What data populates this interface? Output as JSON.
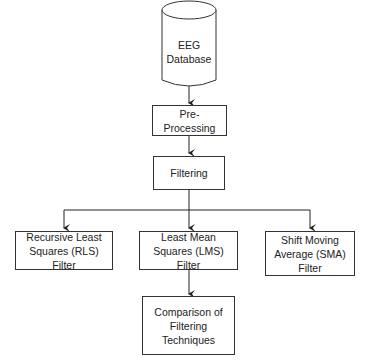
{
  "diagram": {
    "type": "flowchart",
    "nodes": {
      "database": {
        "line1": "EEG",
        "line2": "Database",
        "shape": "cylinder"
      },
      "preprocessing": {
        "label": "Pre-Processing"
      },
      "filtering": {
        "label": "Filtering"
      },
      "rls": {
        "label": "Recursive Least Squares (RLS) Filter"
      },
      "lms": {
        "label": "Least Mean Squares (LMS) Filter"
      },
      "sma": {
        "label": "Shift Moving Average (SMA) Filter"
      },
      "comparison": {
        "label": "Comparison of Filtering Techniques"
      }
    },
    "edges": [
      [
        "database",
        "preprocessing"
      ],
      [
        "preprocessing",
        "filtering"
      ],
      [
        "filtering",
        "rls"
      ],
      [
        "filtering",
        "lms"
      ],
      [
        "filtering",
        "sma"
      ],
      [
        "lms",
        "comparison"
      ]
    ],
    "colors": {
      "stroke": "#333333",
      "fill": "#ffffff",
      "text": "#222222"
    }
  }
}
